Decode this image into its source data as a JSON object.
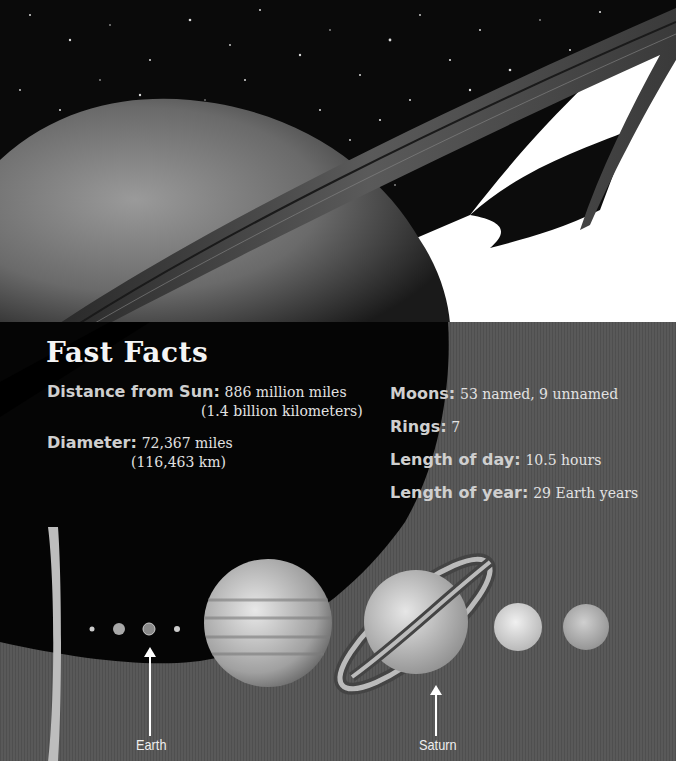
{
  "header_image": {
    "subject": "Saturn with rings against starfield",
    "icon": "saturn-planet-image"
  },
  "fast_facts": {
    "title": "Fast Facts",
    "left": [
      {
        "label": "Distance from Sun:",
        "value_line1": "886 million miles",
        "value_line2": "(1.4 billion kilometers)"
      },
      {
        "label": "Diameter:",
        "value_line1": "72,367 miles",
        "value_line2": "(116,463 km)"
      }
    ],
    "right": [
      {
        "label": "Moons:",
        "value": "53 named, 9 unnamed"
      },
      {
        "label": "Rings:",
        "value": "7"
      },
      {
        "label": "Length of day:",
        "value": "10.5 hours"
      },
      {
        "label": "Length of year:",
        "value": "29 Earth years"
      }
    ]
  },
  "planet_lineup": {
    "captions": {
      "earth": "Earth",
      "saturn": "Saturn"
    },
    "planets": [
      "Sun edge",
      "Mercury",
      "Venus",
      "Earth",
      "Mars",
      "Jupiter",
      "Saturn",
      "Uranus",
      "Neptune"
    ]
  },
  "colors": {
    "panel_bg": "#545454",
    "title_text": "#f4f4f4",
    "label_text": "#cfcfcf",
    "value_text": "#e2e2e2"
  }
}
